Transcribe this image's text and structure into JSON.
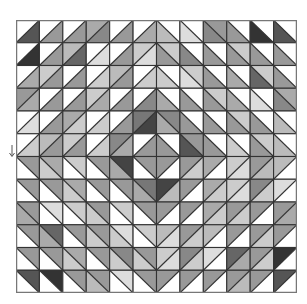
{
  "figure": {
    "rows": 12,
    "cols": 12,
    "grid_stroke": "#333333",
    "frame_stroke": "#777777",
    "quadrant_diagonals": {
      "top_left": "/",
      "top_right": "\\",
      "bottom_left": "\\",
      "bottom_right": "/"
    },
    "cells": [
      [
        [
          "#ffffff",
          "#555555"
        ],
        [
          "#ffffff",
          "#999999"
        ],
        [
          "#ffffff",
          "#999999"
        ],
        [
          "#aaaaaa",
          "#888888"
        ],
        [
          "#ffffff",
          "#999999"
        ],
        [
          "#ffffff",
          "#aaaaaa"
        ],
        [
          "#ffffff",
          "#bbbbbb"
        ],
        [
          "#ffffff",
          "#dddddd"
        ],
        [
          "#999999",
          "#888888"
        ],
        [
          "#ffffff",
          "#999999"
        ],
        [
          "#ffffff",
          "#333333"
        ],
        [
          "#ffffff",
          "#555555"
        ]
      ],
      [
        [
          "#ffffff",
          "#333333"
        ],
        [
          "#ffffff",
          "#999999"
        ],
        [
          "#bbbbbb",
          "#666666"
        ],
        [
          "#ffffff",
          "#dddddd"
        ],
        [
          "#ffffff",
          "#999999"
        ],
        [
          "#cccccc",
          "#dddddd"
        ],
        [
          "#cccccc",
          "#999999"
        ],
        [
          "#ffffff",
          "#888888"
        ],
        [
          "#ffffff",
          "#999999"
        ],
        [
          "#cccccc",
          "#999999"
        ],
        [
          "#ffffff",
          "#999999"
        ],
        [
          "#ffffff",
          "#999999"
        ]
      ],
      [
        [
          "#ffffff",
          "#aaaaaa"
        ],
        [
          "#cccccc",
          "#999999"
        ],
        [
          "#ffffff",
          "#999999"
        ],
        [
          "#ffffff",
          "#cccccc"
        ],
        [
          "#bbbbbb",
          "#999999"
        ],
        [
          "#ffffff",
          "#cccccc"
        ],
        [
          "#ffffff",
          "#cccccc"
        ],
        [
          "#cccccc",
          "#dddddd"
        ],
        [
          "#ffffff",
          "#999999"
        ],
        [
          "#ffffff",
          "#aaaaaa"
        ],
        [
          "#cccccc",
          "#666666"
        ],
        [
          "#ffffff",
          "#999999"
        ]
      ],
      [
        [
          "#999999",
          "#aaaaaa"
        ],
        [
          "#ffffff",
          "#999999"
        ],
        [
          "#ffffff",
          "#999999"
        ],
        [
          "#cccccc",
          "#aaaaaa"
        ],
        [
          "#ffffff",
          "#999999"
        ],
        [
          "#ffffff",
          "#888888"
        ],
        [
          "#ffffff",
          "#aaaaaa"
        ],
        [
          "#ffffff",
          "#999999"
        ],
        [
          "#cccccc",
          "#999999"
        ],
        [
          "#ffffff",
          "#aaaaaa"
        ],
        [
          "#ffffff",
          "#dddddd"
        ],
        [
          "#aaaaaa",
          "#888888"
        ]
      ],
      [
        [
          "#ffffff",
          "#dddddd"
        ],
        [
          "#ffffff",
          "#999999"
        ],
        [
          "#aaaaaa",
          "#cccccc"
        ],
        [
          "#ffffff",
          "#cccccc"
        ],
        [
          "#ffffff",
          "#999999"
        ],
        [
          "#777777",
          "#444444"
        ],
        [
          "#888888",
          "#aaaaaa"
        ],
        [
          "#ffffff",
          "#999999"
        ],
        [
          "#ffffff",
          "#999999"
        ],
        [
          "#cccccc",
          "#999999"
        ],
        [
          "#ffffff",
          "#999999"
        ],
        [
          "#ffffff",
          "#bbbbbb"
        ]
      ],
      [
        [
          "#ffffff",
          "#cccccc"
        ],
        [
          "#bbbbbb",
          "#999999"
        ],
        [
          "#cccccc",
          "#999999"
        ],
        [
          "#ffffff",
          "#cccccc"
        ],
        [
          "#888888",
          "#aaaaaa"
        ],
        [
          "#ffffff",
          "#999999"
        ],
        [
          "#ffffff",
          "#999999"
        ],
        [
          "#999999",
          "#555555"
        ],
        [
          "#ffffff",
          "#999999"
        ],
        [
          "#ffffff",
          "#cccccc"
        ],
        [
          "#cccccc",
          "#999999"
        ],
        [
          "#ffffff",
          "#bbbbbb"
        ]
      ],
      [
        [
          "#999999",
          "#ffffff"
        ],
        [
          "#aaaaaa",
          "#cccccc"
        ],
        [
          "#cccccc",
          "#ffffff"
        ],
        [
          "#999999",
          "#ffffff"
        ],
        [
          "#444444",
          "#aaaaaa"
        ],
        [
          "#999999",
          "#ffffff"
        ],
        [
          "#999999",
          "#ffffff"
        ],
        [
          "#999999",
          "#cccccc"
        ],
        [
          "#aaaaaa",
          "#ffffff"
        ],
        [
          "#cccccc",
          "#dddddd"
        ],
        [
          "#999999",
          "#bbbbbb"
        ],
        [
          "#bbbbbb",
          "#ffffff"
        ]
      ],
      [
        [
          "#999999",
          "#ffffff"
        ],
        [
          "#999999",
          "#ffffff"
        ],
        [
          "#aaaaaa",
          "#cccccc"
        ],
        [
          "#999999",
          "#ffffff"
        ],
        [
          "#999999",
          "#ffffff"
        ],
        [
          "#777777",
          "#aaaaaa"
        ],
        [
          "#444444",
          "#bbbbbb"
        ],
        [
          "#999999",
          "#ffffff"
        ],
        [
          "#aaaaaa",
          "#cccccc"
        ],
        [
          "#cccccc",
          "#dddddd"
        ],
        [
          "#888888",
          "#cccccc"
        ],
        [
          "#dddddd",
          "#ffffff"
        ]
      ],
      [
        [
          "#999999",
          "#aaaaaa"
        ],
        [
          "#dddddd",
          "#ffffff"
        ],
        [
          "#cccccc",
          "#ffffff"
        ],
        [
          "#999999",
          "#cccccc"
        ],
        [
          "#cccccc",
          "#ffffff"
        ],
        [
          "#999999",
          "#ffffff"
        ],
        [
          "#999999",
          "#ffffff"
        ],
        [
          "#999999",
          "#ffffff"
        ],
        [
          "#aaaaaa",
          "#cccccc"
        ],
        [
          "#999999",
          "#cccccc"
        ],
        [
          "#999999",
          "#ffffff"
        ],
        [
          "#999999",
          "#aaaaaa"
        ]
      ],
      [
        [
          "#999999",
          "#ffffff"
        ],
        [
          "#666666",
          "#aaaaaa"
        ],
        [
          "#999999",
          "#ffffff"
        ],
        [
          "#999999",
          "#cccccc"
        ],
        [
          "#dddddd",
          "#cccccc"
        ],
        [
          "#cccccc",
          "#ffffff"
        ],
        [
          "#bbbbbb",
          "#dddddd"
        ],
        [
          "#999999",
          "#cccccc"
        ],
        [
          "#bbbbbb",
          "#ffffff"
        ],
        [
          "#999999",
          "#ffffff"
        ],
        [
          "#999999",
          "#cccccc"
        ],
        [
          "#999999",
          "#ffffff"
        ]
      ],
      [
        [
          "#999999",
          "#ffffff"
        ],
        [
          "#999999",
          "#ffffff"
        ],
        [
          "#aaaaaa",
          "#cccccc"
        ],
        [
          "#999999",
          "#ffffff"
        ],
        [
          "#888888",
          "#cccccc"
        ],
        [
          "#999999",
          "#cccccc"
        ],
        [
          "#cccccc",
          "#dddddd"
        ],
        [
          "#888888",
          "#cccccc"
        ],
        [
          "#dddddd",
          "#ffffff"
        ],
        [
          "#666666",
          "#aaaaaa"
        ],
        [
          "#999999",
          "#cccccc"
        ],
        [
          "#333333",
          "#ffffff"
        ]
      ],
      [
        [
          "#555555",
          "#ffffff"
        ],
        [
          "#333333",
          "#ffffff"
        ],
        [
          "#999999",
          "#ffffff"
        ],
        [
          "#999999",
          "#bbbbbb"
        ],
        [
          "#dddddd",
          "#ffffff"
        ],
        [
          "#999999",
          "#ffffff"
        ],
        [
          "#999999",
          "#ffffff"
        ],
        [
          "#999999",
          "#ffffff"
        ],
        [
          "#999999",
          "#ffffff"
        ],
        [
          "#999999",
          "#bbbbbb"
        ],
        [
          "#999999",
          "#ffffff"
        ],
        [
          "#555555",
          "#ffffff"
        ]
      ]
    ]
  },
  "margin_marker": {
    "icon": "down-arrow-icon",
    "glyph": "↓"
  }
}
